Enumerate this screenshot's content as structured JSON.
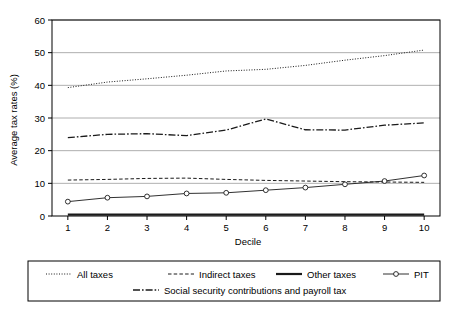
{
  "chart_data": {
    "type": "line",
    "title": "",
    "xlabel": "Decile",
    "ylabel": "Average tax rates (%)",
    "categories": [
      "1",
      "2",
      "3",
      "4",
      "5",
      "6",
      "7",
      "8",
      "9",
      "10"
    ],
    "x": [
      1,
      2,
      3,
      4,
      5,
      6,
      7,
      8,
      9,
      10
    ],
    "xlim": [
      0.6,
      10.4
    ],
    "ylim": [
      0,
      60
    ],
    "yticks": [
      0,
      10,
      20,
      30,
      40,
      50,
      60
    ],
    "xticks": [
      "1",
      "2",
      "3",
      "4",
      "5",
      "6",
      "7",
      "8",
      "9",
      "10"
    ],
    "grid": true,
    "legend_position": "bottom",
    "series": [
      {
        "name": "All taxes",
        "style": "dotted",
        "marker": "none",
        "color": "#1a1a1a",
        "values": [
          39.3,
          41.0,
          42.0,
          43.1,
          44.4,
          44.9,
          46.1,
          47.7,
          49.1,
          50.8
        ]
      },
      {
        "name": "Indirect taxes",
        "style": "dashed",
        "marker": "none",
        "color": "#1a1a1a",
        "values": [
          11.0,
          11.2,
          11.5,
          11.6,
          11.2,
          10.9,
          10.7,
          10.5,
          10.4,
          10.3
        ]
      },
      {
        "name": "Other taxes",
        "style": "solid-thick",
        "marker": "none",
        "color": "#1a1a1a",
        "values": [
          0.4,
          0.4,
          0.4,
          0.4,
          0.4,
          0.4,
          0.4,
          0.4,
          0.4,
          0.4
        ]
      },
      {
        "name": "PIT",
        "style": "solid-marker",
        "marker": "circle",
        "color": "#1a1a1a",
        "values": [
          4.4,
          5.6,
          6.0,
          6.9,
          7.1,
          7.9,
          8.7,
          9.7,
          10.7,
          12.4
        ]
      },
      {
        "name": "Social security contributions and payroll tax",
        "style": "dashdot",
        "marker": "none",
        "color": "#1a1a1a",
        "values": [
          24.0,
          25.0,
          25.2,
          24.6,
          26.3,
          29.7,
          26.4,
          26.3,
          27.8,
          28.5
        ]
      }
    ],
    "legend_entries": [
      {
        "label": "All taxes",
        "style": "dotted",
        "marker": "none",
        "row": 0
      },
      {
        "label": "Indirect taxes",
        "style": "dashed",
        "marker": "none",
        "row": 0
      },
      {
        "label": "Other taxes",
        "style": "solid-thick",
        "marker": "none",
        "row": 0
      },
      {
        "label": "PIT",
        "style": "solid-marker",
        "marker": "circle",
        "row": 0
      },
      {
        "label": "Social security contributions and payroll tax",
        "style": "dashdot",
        "marker": "none",
        "row": 1
      }
    ]
  },
  "colors": {
    "ink": "#1a1a1a",
    "grid": "#9a9a9a",
    "frame": "#000000",
    "background": "#ffffff"
  }
}
